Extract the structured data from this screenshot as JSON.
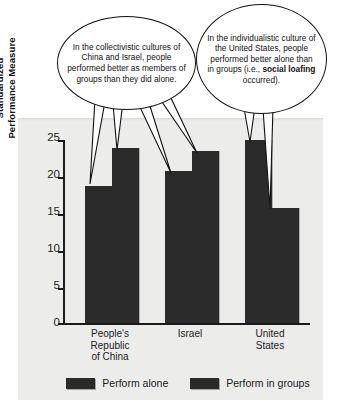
{
  "chart_data": {
    "type": "bar",
    "title": "",
    "xlabel": "",
    "ylabel": "Standardized Performance Measure",
    "ylabel_lines": [
      "Standardized",
      "Performance Measure"
    ],
    "categories": [
      "People's Republic of China",
      "Israel",
      "United States"
    ],
    "category_lines": [
      [
        "People's",
        "Republic",
        "of China"
      ],
      [
        "Israel"
      ],
      [
        "United",
        "States"
      ]
    ],
    "series": [
      {
        "name": "Perform alone",
        "values": [
          18.5,
          20.5,
          24.7
        ]
      },
      {
        "name": "Perform in groups",
        "values": [
          23.7,
          23.2,
          15.6
        ]
      }
    ],
    "ylim": [
      0,
      25
    ],
    "yticks": [
      0,
      5,
      10,
      15,
      20,
      25
    ],
    "ytick_labels": [
      "0",
      "5",
      "10",
      "15",
      "20",
      "25"
    ],
    "grid": false,
    "legend_position": "bottom",
    "bar_color": "#2b2b2b",
    "panel_color": "#ececeb",
    "axis_color": "#1b1b1b"
  },
  "legend": {
    "items": [
      {
        "label": "Perform alone"
      },
      {
        "label": "Perform in groups"
      }
    ]
  },
  "callouts": {
    "left": {
      "text": "In the collectivistic cultures of China and Israel, people performed better as members of groups than they did alone."
    },
    "right": {
      "text_before": "In the individualistic culture of the United States, people performed better alone than in groups (i.e., ",
      "emphasis": "social loafing",
      "text_after": " occurred)."
    }
  }
}
